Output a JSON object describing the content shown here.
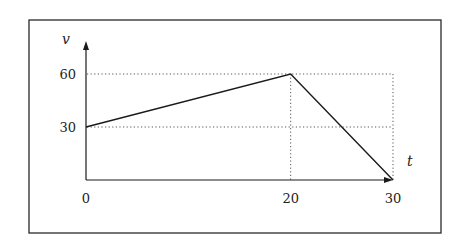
{
  "chart_data": {
    "type": "line",
    "title": "",
    "xlabel": "t",
    "ylabel": "v",
    "x": [
      0,
      20,
      30
    ],
    "series": [
      {
        "name": "v(t)",
        "values": [
          30,
          60,
          0
        ]
      }
    ],
    "xticks": [
      0,
      20,
      30
    ],
    "yticks": [
      30,
      60
    ],
    "xlim": [
      0,
      30
    ],
    "ylim": [
      0,
      60
    ],
    "grid": "dotted guide lines at v=30, v=60, t=20, t=30",
    "legend": null
  },
  "labels": {
    "x_axis": "t",
    "y_axis": "v",
    "x_ticks": [
      "0",
      "20",
      "30"
    ],
    "y_ticks": [
      "30",
      "60"
    ]
  },
  "colors": {
    "line": "#1a1a1a",
    "frame": "#2a2a2a",
    "background": "#ffffff"
  }
}
